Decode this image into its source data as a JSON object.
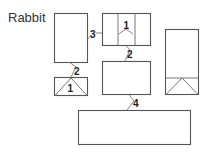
{
  "diagram": {
    "title": "Rabbit",
    "labels": {
      "box_a_to_b": "3",
      "box_b_inner": "1",
      "box_a_to_c": "2",
      "box_c_inner": "1",
      "box_b_to_d": "2",
      "box_d_to_e": "4"
    },
    "colors": {
      "stroke": "#555555",
      "text": "#333333",
      "background": "#ffffff"
    }
  }
}
